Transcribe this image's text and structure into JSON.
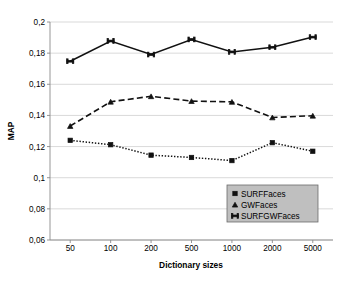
{
  "chart_data": {
    "type": "line",
    "title": "",
    "xlabel": "Dictionary sizes",
    "ylabel": "MAP",
    "categories": [
      "50",
      "100",
      "200",
      "500",
      "1000",
      "2000",
      "5000"
    ],
    "x_tick_labels": [
      "50",
      "100",
      "200",
      "500",
      "1000",
      "2000",
      "5000"
    ],
    "y_tick_labels": [
      "0,2",
      "0,18",
      "0,16",
      "0,14",
      "0,12",
      "0,1",
      "0,08",
      "0,06"
    ],
    "y_tick_values": [
      0.2,
      0.18,
      0.16,
      0.14,
      0.12,
      0.1,
      0.08,
      0.06
    ],
    "ylim": [
      0.06,
      0.2
    ],
    "grid": "horizontal",
    "legend_position": "inside-bottom-right",
    "decimal_separator": ",",
    "series": [
      {
        "name": "SURFFaces",
        "marker": "square",
        "line_style": "dotted",
        "color": "#111111",
        "values": [
          0.124,
          0.1212,
          0.1145,
          0.113,
          0.111,
          0.1225,
          0.117
        ]
      },
      {
        "name": "GWFaces",
        "marker": "triangle",
        "line_style": "dashed",
        "color": "#111111",
        "values": [
          0.1332,
          0.1488,
          0.1523,
          0.1492,
          0.1487,
          0.1387,
          0.1398
        ]
      },
      {
        "name": "SURFGWFaces",
        "marker": "bowtie",
        "line_style": "solid",
        "color": "#111111",
        "values": [
          0.1748,
          0.1878,
          0.1791,
          0.1888,
          0.1808,
          0.1838,
          0.1903
        ]
      }
    ],
    "legend": [
      {
        "label": "SURFFaces",
        "marker": "square"
      },
      {
        "label": "GWFaces",
        "marker": "triangle"
      },
      {
        "label": "SURFGWFaces",
        "marker": "bowtie"
      }
    ]
  }
}
